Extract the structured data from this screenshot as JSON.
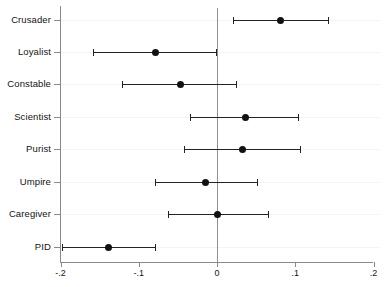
{
  "chart_data": {
    "type": "scatter",
    "title": "",
    "subtitle": "",
    "xlabel": "",
    "ylabel": "",
    "caption": "",
    "orientation": "horizontal",
    "grid": true,
    "legend": "none",
    "reference_line": 0,
    "xlim": [
      -0.2,
      0.2
    ],
    "xticks": [
      -0.2,
      -0.1,
      0,
      0.1,
      0.2
    ],
    "xtick_labels": [
      "-.2",
      "-.1",
      "0",
      ".1",
      ".2"
    ],
    "categories": [
      "Crusader",
      "Loyalist",
      "Constable",
      "Scientist",
      "Purist",
      "Umpire",
      "Caregiver",
      "PID"
    ],
    "series": [
      {
        "name": "Coefficient",
        "point_estimates": [
          0.081,
          -0.079,
          -0.047,
          0.037,
          0.033,
          -0.015,
          0.0,
          -0.139
        ],
        "ci_low": [
          0.02,
          -0.158,
          -0.121,
          -0.035,
          -0.042,
          -0.079,
          -0.063,
          -0.198
        ],
        "ci_high": [
          0.142,
          -0.001,
          0.024,
          0.104,
          0.106,
          0.051,
          0.065,
          -0.079
        ]
      }
    ]
  },
  "colors": {
    "marker": "#111111",
    "interval": "#232323",
    "axis": "#8a8a8a",
    "grid": "#f4f4f4",
    "background": "#ffffff"
  }
}
